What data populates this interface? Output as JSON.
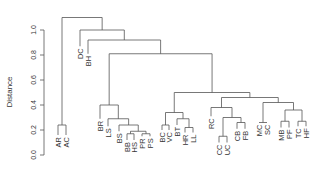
{
  "chart_data": {
    "type": "dendrogram",
    "title": "",
    "xlabel": "",
    "ylabel": "Distance",
    "ylim": [
      0,
      1.0
    ],
    "yticks": [
      0.0,
      0.2,
      0.4,
      0.6,
      0.8,
      1.0
    ],
    "ytick_labels": [
      "0.0",
      "0.2",
      "0.4",
      "0.6",
      "0.8",
      "1.0"
    ],
    "grid": false,
    "leaves": [
      "AR",
      "AC",
      "DC",
      "BH",
      "BR",
      "LS",
      "BS",
      "BB",
      "HS",
      "PR",
      "PS",
      "BC",
      "VC",
      "BT",
      "HR",
      "LL",
      "RC",
      "CC",
      "UC",
      "CB",
      "FB",
      "MC",
      "SC",
      "MB",
      "PF",
      "TC",
      "HF"
    ],
    "leaf_x": [
      58,
      66,
      80,
      88,
      100,
      108,
      119,
      127,
      134,
      142,
      150,
      162,
      169,
      177,
      185,
      193,
      211,
      219,
      227,
      237,
      245,
      259,
      267,
      281,
      289,
      298,
      306
    ],
    "leaf_heights": [
      0.16,
      0.16,
      0.87,
      0.81,
      0.29,
      0.23,
      0.19,
      0.12,
      0.12,
      0.15,
      0.15,
      0.2,
      0.2,
      0.24,
      0.18,
      0.18,
      0.31,
      0.1,
      0.1,
      0.21,
      0.21,
      0.26,
      0.26,
      0.22,
      0.22,
      0.23,
      0.23
    ],
    "merges": [
      {
        "id": "m1",
        "left": "CC",
        "right": "UC",
        "height": 0.15
      },
      {
        "id": "m2",
        "left": "BB",
        "right": "HS",
        "height": 0.17
      },
      {
        "id": "m3",
        "left": "PR",
        "right": "PS",
        "height": 0.17
      },
      {
        "id": "m4",
        "left": "HR",
        "right": "LL",
        "height": 0.22
      },
      {
        "id": "m5",
        "left": "AR",
        "right": "AC",
        "height": 0.24
      },
      {
        "id": "m6",
        "left": "BC",
        "right": "VC",
        "height": 0.24
      },
      {
        "id": "m7",
        "left": "CB",
        "right": "FB",
        "height": 0.26
      },
      {
        "id": "m8",
        "left": "MB",
        "right": "PF",
        "height": 0.27
      },
      {
        "id": "m9",
        "left": "TC",
        "right": "HF",
        "height": 0.27
      },
      {
        "id": "m10",
        "left": "m2",
        "right": "m3",
        "height": 0.19
      },
      {
        "id": "m11",
        "left": "BS",
        "right": "m10",
        "height": 0.24
      },
      {
        "id": "m12",
        "left": "LS",
        "right": "m11",
        "height": 0.29
      },
      {
        "id": "m13",
        "left": "BT",
        "right": "m4",
        "height": 0.29
      },
      {
        "id": "m14",
        "left": "m6",
        "right": "m13",
        "height": 0.34
      },
      {
        "id": "m15",
        "left": "m1",
        "right": "m7",
        "height": 0.3
      },
      {
        "id": "m16",
        "left": "RC",
        "right": "m15",
        "height": 0.38
      },
      {
        "id": "m17",
        "left": "m8",
        "right": "m9",
        "height": 0.36
      },
      {
        "id": "m18",
        "left": "MC",
        "right": "SC",
        "height": 0.26
      },
      {
        "id": "m19",
        "left": "m18",
        "right": "m17",
        "height": 0.42
      },
      {
        "id": "m20",
        "left": "m16",
        "right": "m19",
        "height": 0.46
      },
      {
        "id": "m21",
        "left": "m14",
        "right": "m20",
        "height": 0.5
      },
      {
        "id": "m22",
        "left": "BR",
        "right": "m12",
        "height": 0.4
      },
      {
        "id": "m23",
        "left": "m22",
        "right": "m21",
        "height": 0.81
      },
      {
        "id": "m24",
        "left": "BH",
        "right": "m23",
        "height": 0.92
      },
      {
        "id": "m25",
        "left": "DC",
        "right": "m24",
        "height": 1.0
      },
      {
        "id": "m26",
        "left": "m5",
        "right": "m25",
        "height": 1.1
      }
    ]
  },
  "axis": {
    "ylabel": "Distance"
  },
  "colors": {
    "lines": "#555555",
    "text": "#333333",
    "background": "#ffffff"
  }
}
